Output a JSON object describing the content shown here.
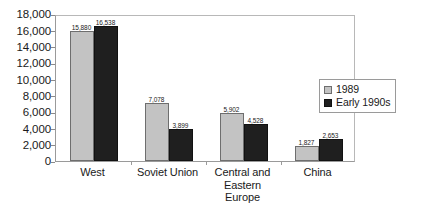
{
  "chart_data": {
    "type": "bar",
    "title": "",
    "subtitle": "",
    "xlabel": "",
    "ylabel": "",
    "categories": [
      "West",
      "Soviet Union",
      "Central and Eastern Europe",
      "China"
    ],
    "series": [
      {
        "name": "1989",
        "color": "#c3c3c3",
        "values": [
          15880,
          7078,
          5902,
          1827
        ],
        "labels": [
          "15,880",
          "7,078",
          "5,902",
          "1,827"
        ]
      },
      {
        "name": "Early 1990s",
        "color": "#1f1f1f",
        "values": [
          16538,
          3899,
          4528,
          2653
        ],
        "labels": [
          "16,538",
          "3,899",
          "4,528",
          "2,653"
        ]
      }
    ],
    "ylim": [
      0,
      18000
    ],
    "ytick_step": 2000,
    "yticks": [
      18000,
      16000,
      14000,
      12000,
      10000,
      8000,
      6000,
      4000,
      2000,
      0
    ],
    "ytick_labels": [
      "18,000",
      "16,000",
      "14,000",
      "12,000",
      "10,000",
      "8,000",
      "6,000",
      "4,000",
      "2,000",
      "0"
    ],
    "grid": false,
    "legend_position": "right",
    "data_labels": true
  },
  "axis": {
    "y_tick_labels": [
      "18,000",
      "16,000",
      "14,000",
      "12,000",
      "10,000",
      "8,000",
      "6,000",
      "4,000",
      "2,000",
      "0"
    ],
    "x_category_labels": [
      "West",
      "Soviet Union",
      "Central and Eastern Europe",
      "China"
    ]
  },
  "legend": {
    "entries": [
      {
        "label": "1989",
        "swatch": "legend-swatch-1989"
      },
      {
        "label": "Early 1990s",
        "swatch": "legend-swatch-early-1990s"
      }
    ]
  },
  "values": {
    "west_1989": "15,880",
    "west_early1990s": "16,538",
    "soviet_1989": "7,078",
    "soviet_early1990s": "3,899",
    "cee_1989": "5,902",
    "cee_early1990s": "4,528",
    "china_1989": "1,827",
    "china_early1990s": "2,653"
  },
  "colors": {
    "series_1989": "#c3c3c3",
    "series_early_1990s": "#1f1f1f",
    "plot_border": "#9a9a9a",
    "text": "#1a1a1a"
  }
}
